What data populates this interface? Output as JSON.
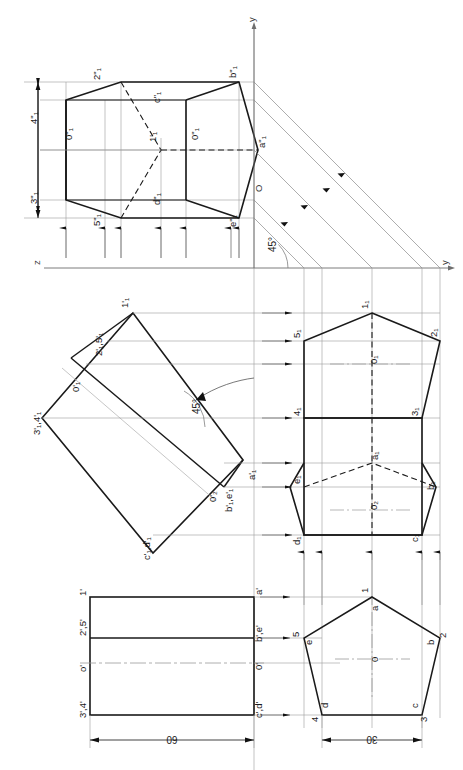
{
  "drawing": {
    "title": "Orthographic projection of a pentagonal prism with auxiliary views",
    "colors": {
      "object_line": "#1a1a1a",
      "thin_line": "#808080",
      "center_line": "#9a9a9a",
      "hidden_line": "#1a1a1a",
      "background": "#ffffff"
    },
    "axes": {
      "y_top": "y",
      "y_right": "y",
      "z_left": "z",
      "origin": "O",
      "angle_45_upper": "45°",
      "angle_45_mid": "45°"
    },
    "dimensions": [
      {
        "name": "front-view-length",
        "value": "60"
      },
      {
        "name": "top-view-width",
        "value": "30"
      }
    ],
    "views": {
      "front_view": {
        "name": "front-view-rectangle",
        "labels": [
          "1'",
          "2',5'",
          "o'",
          "3',4'",
          "a'",
          "b',e'",
          "0'",
          "c',d'"
        ]
      },
      "top_view": {
        "name": "top-view-pentagon",
        "vertex_numbers": [
          "1",
          "2",
          "3",
          "4",
          "5"
        ],
        "vertex_letters": [
          "a",
          "b",
          "c",
          "d",
          "e"
        ],
        "center": "0"
      },
      "auxiliary_inclined": {
        "name": "auxiliary-inclined-rectangle",
        "labels": [
          "1'₁",
          "2'₁,5'₁",
          "0'₁",
          "3'₁,4'₁",
          "a'₁",
          "b'₁,e'₁",
          "0'₁",
          "c'₁,d'₁"
        ],
        "angle": "45°"
      },
      "auxiliary_pentagon": {
        "name": "auxiliary-rotated-pentagon",
        "labels": [
          "1₁",
          "2₁",
          "3₁",
          "4₁",
          "5₁",
          "a₁",
          "b₁",
          "c₁",
          "d₁",
          "e₁",
          "0₁",
          "0₂"
        ]
      },
      "auxiliary_top": {
        "name": "auxiliary-top-projection",
        "labels": [
          "2\"₁",
          "4\"₁",
          "3\"₁",
          "5\"₁",
          "1'₁",
          "0\"₁",
          "c\"₁",
          "d\"₁",
          "b\"₁",
          "a\"₁",
          "e\"₁"
        ]
      }
    },
    "labels": {
      "y_top": "y",
      "y_right": "y",
      "z_left": "z",
      "origin_upper": "O",
      "a2_upper": "a\"₁",
      "b2_upper": "b\"₁",
      "c2_upper": "c\"₁",
      "d2_upper": "d\"₁",
      "e2_upper": "e\"₁",
      "n1_upper": "1'₁",
      "n2_upper": "2\"₁",
      "n3_upper": "3\"₁",
      "n4_upper": "4\"₁",
      "n5_upper": "5\"₁",
      "o_upper_left": "0\"₁",
      "o_upper_right": "0\"₁",
      "deg45_upper": "45°",
      "deg45_mid": "45°",
      "mid_n1": "1'₁",
      "mid_n25": "2'₁,5'₁",
      "mid_o": "0'₁",
      "mid_n34": "3'₁,4'₁",
      "mid_a": "a'₁",
      "mid_be": "b'₁,e'₁",
      "mid_o2": "0'₂",
      "mid_cd": "c'₁,d'₁",
      "pent_n1": "1₁",
      "pent_n2": "2₁",
      "pent_n3": "3₁",
      "pent_n4": "4₁",
      "pent_n5": "5₁",
      "pent_a": "a₁",
      "pent_b": "b₁",
      "pent_c": "c₁",
      "pent_d": "d₁",
      "pent_e": "e₁",
      "pent_o1": "0₁",
      "pent_o2": "0₂",
      "fv_1": "1'",
      "fv_25": "2',5'",
      "fv_o": "o'",
      "fv_34": "3',4'",
      "fv_a": "a'",
      "fv_be": "b',e'",
      "fv_0": "0'",
      "fv_cd": "c',d'",
      "tv_1": "1",
      "tv_2": "2",
      "tv_3": "3",
      "tv_4": "4",
      "tv_5": "5",
      "tv_a": "a",
      "tv_b": "b",
      "tv_c": "c",
      "tv_d": "d",
      "tv_e": "e",
      "tv_o": "0",
      "dim_60": "60",
      "dim_30": "30"
    }
  }
}
